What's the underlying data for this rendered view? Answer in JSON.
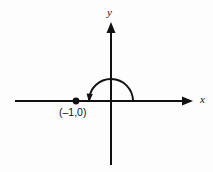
{
  "figure": {
    "name": "angle-on-coordinate-plane",
    "background_color": "#fdfdfd",
    "ink_color": "#111111",
    "axis_labels": {
      "x": "x",
      "y": "y"
    },
    "point_label": "(–1,0)"
  },
  "chart_data": {
    "type": "scatter",
    "title": "",
    "subtitle": "",
    "xlabel": "x",
    "ylabel": "y",
    "grid": false,
    "legend": null,
    "axis_style": "arrow-terminated standard xy axes through origin",
    "xlim": [
      -4.4,
      4.4
    ],
    "ylim": [
      -3.5,
      3.6
    ],
    "origin_px": {
      "x": 111,
      "y": 101
    },
    "unit_px": 22,
    "points": [
      {
        "label": "(–1,0)",
        "x": -1,
        "y": 0,
        "marker": "filled-circle",
        "marker_px": {
          "x": 76,
          "y": 101
        },
        "label_anchor": "below-left",
        "label_px": {
          "x": 59,
          "y": 112
        }
      }
    ],
    "annotations": [
      {
        "kind": "angle-arc",
        "description": "semicircular arc sweeping counterclockwise from the positive x-axis to the negative x-axis, terminating in an arrowhead",
        "center": {
          "x": 0,
          "y": 0
        },
        "radius_units": 1,
        "radius_px": 22,
        "start_angle_deg": 0,
        "end_angle_deg": 180,
        "sweep": "counterclockwise",
        "arrow_at": "end",
        "measure_deg": 180
      }
    ],
    "axes": {
      "x_axis_px": {
        "x1": 15,
        "y1": 101,
        "x2": 193,
        "y2": 101,
        "arrow_at": "end"
      },
      "y_axis_px": {
        "x1": 111,
        "y1": 165,
        "x2": 111,
        "y2": 22,
        "arrow_at": "end"
      },
      "x_label_px": {
        "x": 200,
        "y": 103
      },
      "y_label_px": {
        "x": 107,
        "y": 16
      }
    }
  }
}
